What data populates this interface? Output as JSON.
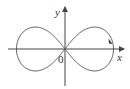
{
  "diagram": {
    "type": "lemniscate",
    "colors": {
      "axis": "#444444",
      "curve": "#555555",
      "background": "#ffffff"
    },
    "axes": {
      "x_label": "x",
      "y_label": "y",
      "origin_label": "0"
    },
    "curve": {
      "x_extent": [
        -1,
        1
      ],
      "direction_marker": "arrow on right lobe, upper-right"
    }
  }
}
